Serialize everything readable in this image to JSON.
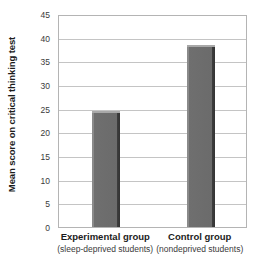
{
  "chart_data": {
    "type": "bar",
    "title": "",
    "xlabel": "",
    "ylabel": "Mean score on critical thinking test",
    "categories": [
      "Experimental group",
      "Control group"
    ],
    "category_sublabels": [
      "(sleep-deprived students)",
      "(nondeprived students)"
    ],
    "values": [
      24.5,
      38.5
    ],
    "series": [
      {
        "name": "Mean score",
        "values": [
          24.5,
          38.5
        ]
      }
    ],
    "ylim": [
      0,
      45
    ],
    "ytick_labels": [
      "0",
      "5",
      "10",
      "15",
      "20",
      "25",
      "30",
      "35",
      "40",
      "45"
    ],
    "ytick_values": [
      0,
      5,
      10,
      15,
      20,
      25,
      30,
      35,
      40,
      45
    ],
    "ytick_step": 5,
    "grid": true,
    "grid_axis": "y",
    "legend": false,
    "legend_position": "none",
    "bar_color": "#6b6b6b",
    "bar_edge_color": "#333333",
    "bar_highlight_color": "#a8a8a8",
    "gridline_color": "#c4c4c4",
    "axis_color": "#b4b4b4",
    "background_color": "#ffffff",
    "text_color": "#1c1c1c"
  }
}
